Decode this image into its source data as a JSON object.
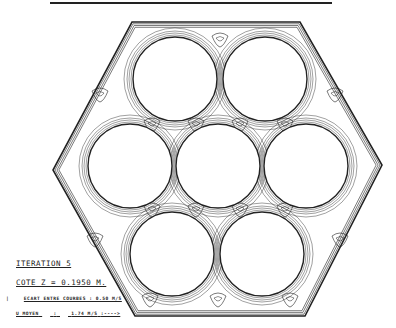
{
  "figure": {
    "type": "velocity isoline plot in hexagonal rod bundle",
    "rods": 7,
    "line_color": "#222222",
    "background": "#ffffff"
  },
  "labels": {
    "iteration": "ITERATION  5",
    "cote": "COTE Z =  0.1950 M.",
    "ecart_marker": "|",
    "ecart": "ECART ENTRE COURBES : 0.50 M/S",
    "umoyen_label": "U  MOYEN",
    "umoyen_sep": ":",
    "umoyen_value": "1.74 M/S",
    "umoyen_arrow": ":---->"
  }
}
